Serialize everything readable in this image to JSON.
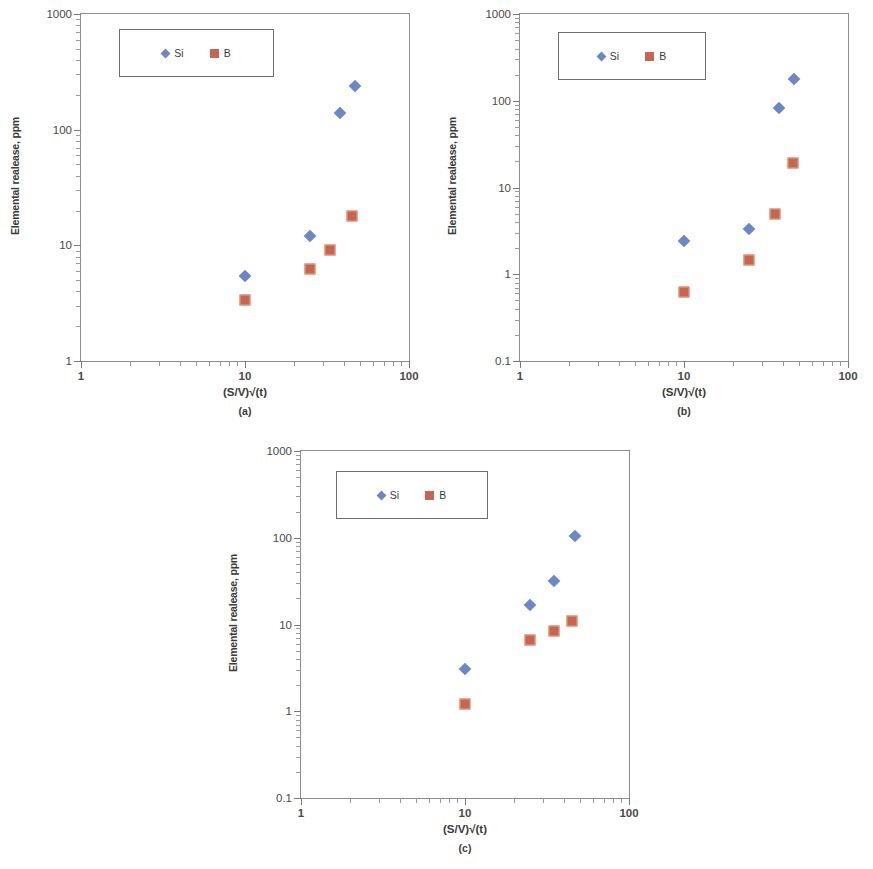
{
  "figure": {
    "panels": [
      {
        "id": "a",
        "caption": "(a)",
        "ylabel": "Elemental realease, ppm",
        "xlabel": "(S/V)√(t)",
        "legend": [
          {
            "label": "Si",
            "marker": "diamond-icon",
            "color": "#6c87c8"
          },
          {
            "label": "B",
            "marker": "square-icon",
            "color": "#c8644f"
          }
        ],
        "ytick_labels": [
          "1000",
          "100",
          "10",
          "1"
        ],
        "xtick_labels": [
          "1",
          "10",
          "100"
        ]
      },
      {
        "id": "b",
        "caption": "(b)",
        "ylabel": "Elemental realease, ppm",
        "xlabel": "(S/V)√(t)",
        "legend": [
          {
            "label": "Si",
            "marker": "diamond-icon",
            "color": "#6c87c8"
          },
          {
            "label": "B",
            "marker": "square-icon",
            "color": "#c8644f"
          }
        ],
        "ytick_labels": [
          "1000",
          "100",
          "10",
          "1",
          "0.1"
        ],
        "xtick_labels": [
          "1",
          "10",
          "100"
        ]
      },
      {
        "id": "c",
        "caption": "(c)",
        "ylabel": "Elemental realease, ppm",
        "xlabel": "(S/V)√(t)",
        "legend": [
          {
            "label": "Si",
            "marker": "diamond-icon",
            "color": "#6c87c8"
          },
          {
            "label": "B",
            "marker": "square-icon",
            "color": "#c8644f"
          }
        ],
        "ytick_labels": [
          "1000",
          "100",
          "10",
          "1",
          "0.1"
        ],
        "xtick_labels": [
          "1",
          "10",
          "100"
        ]
      }
    ]
  },
  "chart_data": [
    {
      "type": "scatter",
      "id": "a",
      "title": "(a)",
      "xlabel": "(S/V)√(t)",
      "ylabel": "Elemental realease, ppm",
      "xscale": "log",
      "yscale": "log",
      "xlim": [
        1,
        100
      ],
      "ylim": [
        1,
        1000
      ],
      "xticks": [
        1,
        10,
        100
      ],
      "yticks": [
        1,
        10,
        100,
        1000
      ],
      "grid": false,
      "legend_position": "upper-left-inside",
      "series": [
        {
          "name": "Si",
          "marker": "diamond",
          "color": "#6c87c8",
          "points": [
            {
              "x": 10,
              "y": 5.4
            },
            {
              "x": 25,
              "y": 12
            },
            {
              "x": 38,
              "y": 140
            },
            {
              "x": 47,
              "y": 240
            }
          ]
        },
        {
          "name": "B",
          "marker": "square",
          "color": "#c8644f",
          "points": [
            {
              "x": 10,
              "y": 3.4
            },
            {
              "x": 25,
              "y": 6.2
            },
            {
              "x": 33,
              "y": 9.2
            },
            {
              "x": 45,
              "y": 18
            }
          ]
        }
      ]
    },
    {
      "type": "scatter",
      "id": "b",
      "title": "(b)",
      "xlabel": "(S/V)√(t)",
      "ylabel": "Elemental realease, ppm",
      "xscale": "log",
      "yscale": "log",
      "xlim": [
        1,
        100
      ],
      "ylim": [
        0.1,
        1000
      ],
      "xticks": [
        1,
        10,
        100
      ],
      "yticks": [
        0.1,
        1,
        10,
        100,
        1000
      ],
      "grid": false,
      "legend_position": "upper-left-inside",
      "series": [
        {
          "name": "Si",
          "marker": "diamond",
          "color": "#6c87c8",
          "points": [
            {
              "x": 10,
              "y": 2.4
            },
            {
              "x": 25,
              "y": 3.3
            },
            {
              "x": 38,
              "y": 83
            },
            {
              "x": 47,
              "y": 180
            }
          ]
        },
        {
          "name": "B",
          "marker": "square",
          "color": "#c8644f",
          "points": [
            {
              "x": 10,
              "y": 0.62
            },
            {
              "x": 25,
              "y": 1.45
            },
            {
              "x": 36,
              "y": 4.9
            },
            {
              "x": 46,
              "y": 19
            }
          ]
        }
      ]
    },
    {
      "type": "scatter",
      "id": "c",
      "title": "(c)",
      "xlabel": "(S/V)√(t)",
      "ylabel": "Elemental realease, ppm",
      "xscale": "log",
      "yscale": "log",
      "xlim": [
        1,
        100
      ],
      "ylim": [
        0.1,
        1000
      ],
      "xticks": [
        1,
        10,
        100
      ],
      "yticks": [
        0.1,
        1,
        10,
        100,
        1000
      ],
      "grid": false,
      "legend_position": "upper-left-inside",
      "series": [
        {
          "name": "Si",
          "marker": "diamond",
          "color": "#6c87c8",
          "points": [
            {
              "x": 10,
              "y": 3.1
            },
            {
              "x": 25,
              "y": 17
            },
            {
              "x": 35,
              "y": 32
            },
            {
              "x": 47,
              "y": 105
            }
          ]
        },
        {
          "name": "B",
          "marker": "square",
          "color": "#c8644f",
          "points": [
            {
              "x": 10,
              "y": 1.2
            },
            {
              "x": 25,
              "y": 6.6
            },
            {
              "x": 35,
              "y": 8.4
            },
            {
              "x": 45,
              "y": 11
            }
          ]
        }
      ]
    }
  ]
}
